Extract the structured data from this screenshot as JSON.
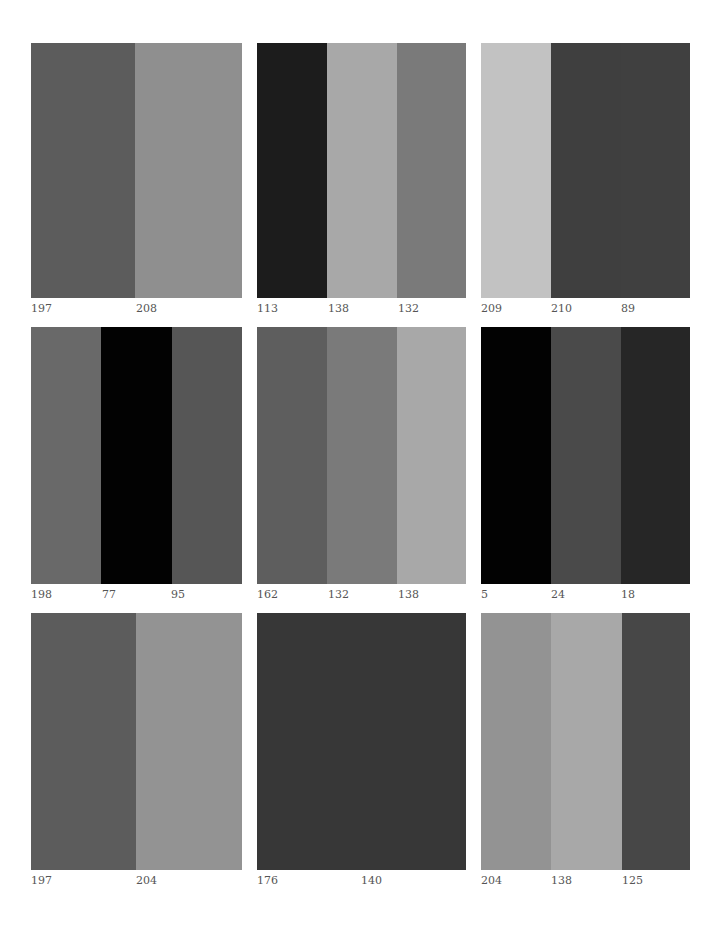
{
  "panels": [
    {
      "x": 31,
      "y": 43,
      "w": 211,
      "h": 255,
      "bands": [
        {
          "w": 104,
          "color": "#5c5c5c"
        },
        {
          "w": 107,
          "color": "#8f8f8f"
        }
      ],
      "labels": [
        {
          "x": 31,
          "text": "197"
        },
        {
          "x": 136,
          "text": "208"
        }
      ]
    },
    {
      "x": 257,
      "y": 43,
      "w": 209,
      "h": 255,
      "bands": [
        {
          "w": 70,
          "color": "#1c1c1c"
        },
        {
          "w": 70,
          "color": "#a8a8a8"
        },
        {
          "w": 69,
          "color": "#7a7a7a"
        }
      ],
      "labels": [
        {
          "x": 257,
          "text": "113"
        },
        {
          "x": 328,
          "text": "138"
        },
        {
          "x": 398,
          "text": "132"
        }
      ]
    },
    {
      "x": 481,
      "y": 43,
      "w": 209,
      "h": 255,
      "bands": [
        {
          "w": 70,
          "color": "#c2c2c2"
        },
        {
          "w": 70,
          "color": "#3f3f3f"
        },
        {
          "w": 69,
          "color": "#404040"
        }
      ],
      "labels": [
        {
          "x": 481,
          "text": "209"
        },
        {
          "x": 551,
          "text": "210"
        },
        {
          "x": 621,
          "text": "89"
        }
      ]
    },
    {
      "x": 31,
      "y": 327,
      "w": 211,
      "h": 257,
      "bands": [
        {
          "w": 70,
          "color": "#696969"
        },
        {
          "w": 71,
          "color": "#020202"
        },
        {
          "w": 70,
          "color": "#565656"
        }
      ],
      "labels": [
        {
          "x": 31,
          "text": "198"
        },
        {
          "x": 102,
          "text": "77"
        },
        {
          "x": 171,
          "text": "95"
        }
      ]
    },
    {
      "x": 257,
      "y": 327,
      "w": 209,
      "h": 257,
      "bands": [
        {
          "w": 70,
          "color": "#5e5e5e"
        },
        {
          "w": 70,
          "color": "#7a7a7a"
        },
        {
          "w": 69,
          "color": "#a8a8a8"
        }
      ],
      "labels": [
        {
          "x": 257,
          "text": "162"
        },
        {
          "x": 328,
          "text": "132"
        },
        {
          "x": 398,
          "text": "138"
        }
      ]
    },
    {
      "x": 481,
      "y": 327,
      "w": 209,
      "h": 257,
      "bands": [
        {
          "w": 70,
          "color": "#020202"
        },
        {
          "w": 70,
          "color": "#4a4a4a"
        },
        {
          "w": 69,
          "color": "#262626"
        }
      ],
      "labels": [
        {
          "x": 481,
          "text": "5"
        },
        {
          "x": 551,
          "text": "24"
        },
        {
          "x": 621,
          "text": "18"
        }
      ]
    },
    {
      "x": 31,
      "y": 613,
      "w": 211,
      "h": 257,
      "bands": [
        {
          "w": 105,
          "color": "#5c5c5c"
        },
        {
          "w": 106,
          "color": "#939393"
        }
      ],
      "labels": [
        {
          "x": 31,
          "text": "197"
        },
        {
          "x": 136,
          "text": "204"
        }
      ]
    },
    {
      "x": 257,
      "y": 613,
      "w": 209,
      "h": 257,
      "bands": [
        {
          "w": 209,
          "color": "#373737"
        }
      ],
      "labels": [
        {
          "x": 257,
          "text": "176"
        },
        {
          "x": 361,
          "text": "140"
        }
      ]
    },
    {
      "x": 481,
      "y": 613,
      "w": 209,
      "h": 257,
      "bands": [
        {
          "w": 70,
          "color": "#939393"
        },
        {
          "w": 71,
          "color": "#a8a8a8"
        },
        {
          "w": 68,
          "color": "#474747"
        }
      ],
      "labels": [
        {
          "x": 481,
          "text": "204"
        },
        {
          "x": 551,
          "text": "138"
        },
        {
          "x": 622,
          "text": "125"
        }
      ]
    }
  ]
}
